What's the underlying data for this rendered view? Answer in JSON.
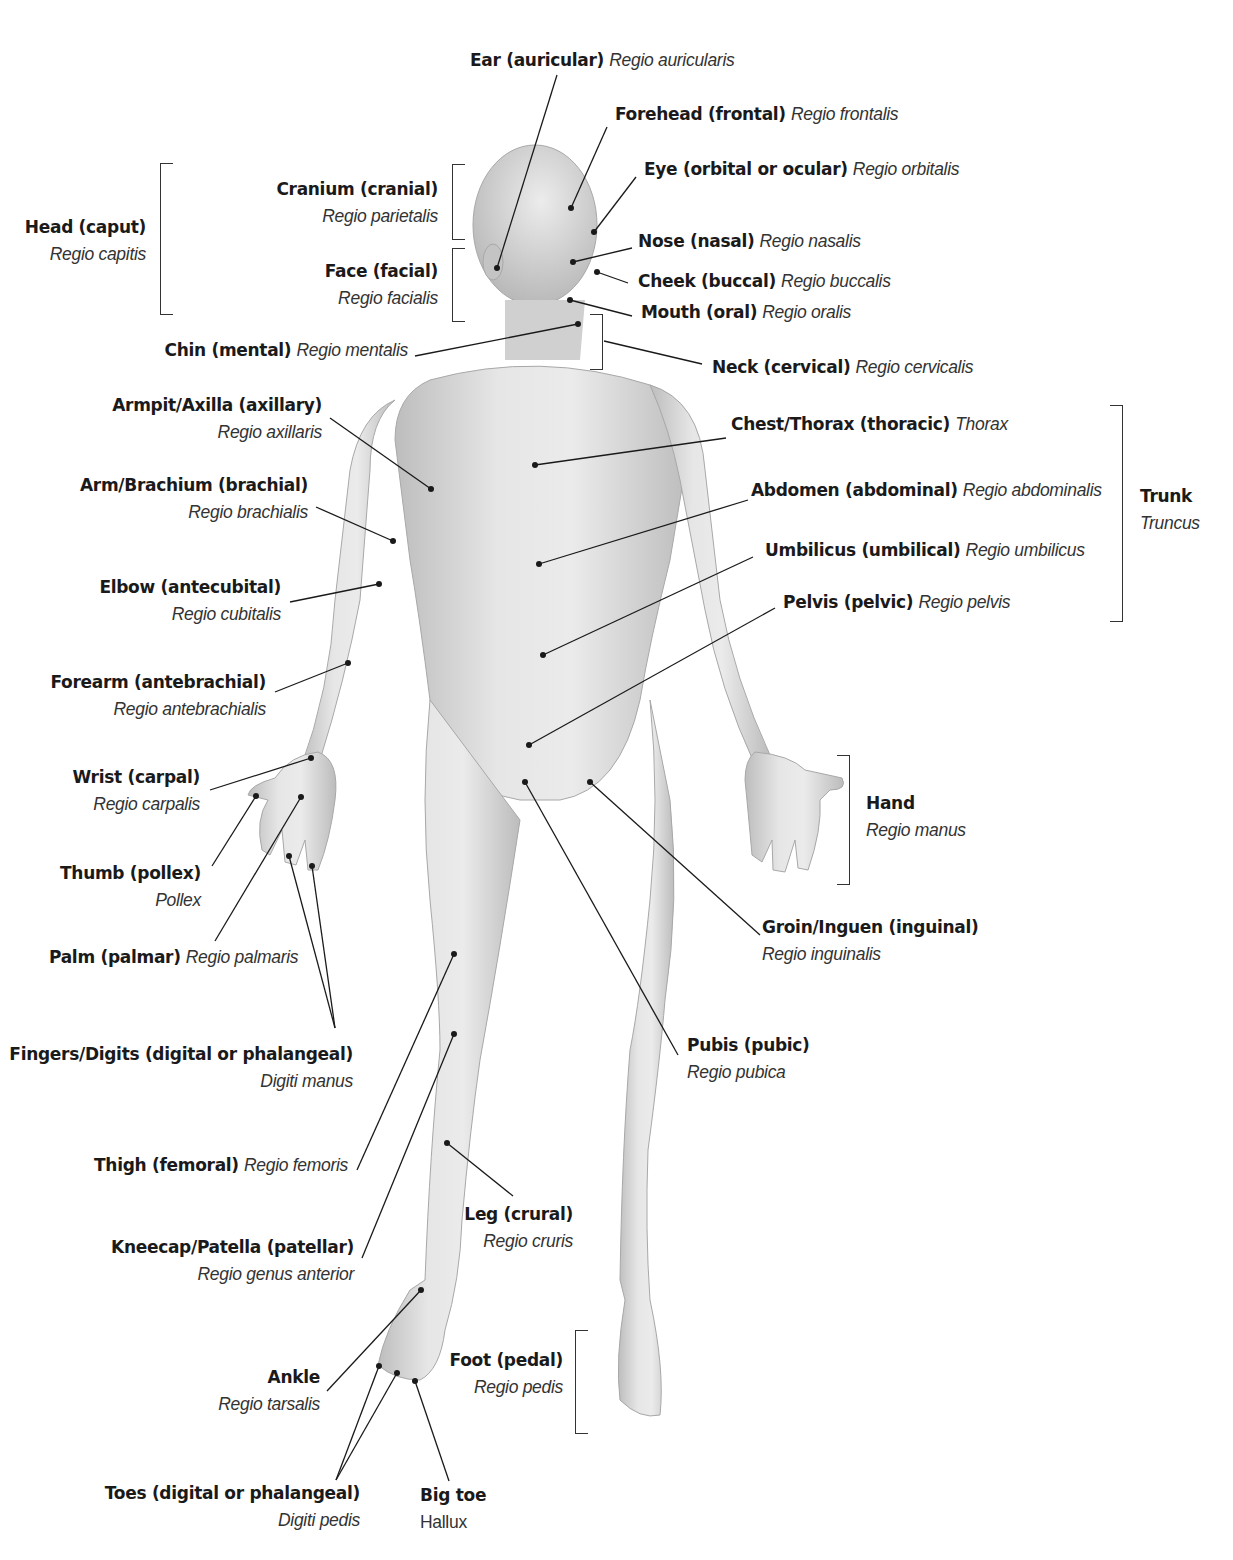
{
  "figure": {
    "skin_tone": "#d9d9d9",
    "line_color": "#1a1a1a"
  },
  "labels": {
    "ear": {
      "en": "Ear (auricular)",
      "la": "Regio auricularis"
    },
    "forehead": {
      "en": "Forehead (frontal)",
      "la": "Regio frontalis"
    },
    "eye": {
      "en": "Eye (orbital or ocular)",
      "la": "Regio orbitalis"
    },
    "cranium": {
      "en": "Cranium (cranial)",
      "la": "Regio parietalis"
    },
    "head": {
      "en": "Head (caput)",
      "la": "Regio capitis"
    },
    "nose": {
      "en": "Nose (nasal)",
      "la": "Regio nasalis"
    },
    "face": {
      "en": "Face (facial)",
      "la": "Regio facialis"
    },
    "cheek": {
      "en": "Cheek (buccal)",
      "la": "Regio buccalis"
    },
    "mouth": {
      "en": "Mouth (oral)",
      "la": "Regio oralis"
    },
    "chin": {
      "en": "Chin (mental)",
      "la": "Regio mentalis"
    },
    "neck": {
      "en": "Neck (cervical)",
      "la": "Regio cervicalis"
    },
    "armpit": {
      "en": "Armpit/Axilla (axillary)",
      "la": "Regio axillaris"
    },
    "chest": {
      "en": "Chest/Thorax (thoracic)",
      "la": "Thorax"
    },
    "arm": {
      "en": "Arm/Brachium (brachial)",
      "la": "Regio brachialis"
    },
    "abdomen": {
      "en": "Abdomen (abdominal)",
      "la": "Regio abdominalis"
    },
    "trunk": {
      "en": "Trunk",
      "la": "Truncus"
    },
    "umbilicus": {
      "en": "Umbilicus (umbilical)",
      "la": "Regio umbilicus"
    },
    "elbow": {
      "en": "Elbow (antecubital)",
      "la": "Regio cubitalis"
    },
    "pelvis": {
      "en": "Pelvis (pelvic)",
      "la": "Regio pelvis"
    },
    "forearm": {
      "en": "Forearm (antebrachial)",
      "la": "Regio antebrachialis"
    },
    "wrist": {
      "en": "Wrist (carpal)",
      "la": "Regio carpalis"
    },
    "hand": {
      "en": "Hand",
      "la": "Regio manus"
    },
    "thumb": {
      "en": "Thumb (pollex)",
      "la": "Pollex"
    },
    "groin": {
      "en": "Groin/Inguen (inguinal)",
      "la": "Regio inguinalis"
    },
    "palm": {
      "en": "Palm (palmar)",
      "la": "Regio palmaris"
    },
    "fingers": {
      "en": "Fingers/Digits (digital or phalangeal)",
      "la": "Digiti manus"
    },
    "pubis": {
      "en": "Pubis (pubic)",
      "la": "Regio pubica"
    },
    "thigh": {
      "en": "Thigh (femoral)",
      "la": "Regio femoris"
    },
    "leg": {
      "en": "Leg (crural)",
      "la": "Regio cruris"
    },
    "kneecap": {
      "en": "Kneecap/Patella (patellar)",
      "la": "Regio genus anterior"
    },
    "ankle": {
      "en": "Ankle",
      "la": "Regio tarsalis"
    },
    "foot": {
      "en": "Foot (pedal)",
      "la": "Regio pedis"
    },
    "toes": {
      "en": "Toes (digital or phalangeal)",
      "la": "Digiti pedis"
    },
    "bigtoe": {
      "en": "Big toe",
      "la": "Hallux"
    }
  }
}
